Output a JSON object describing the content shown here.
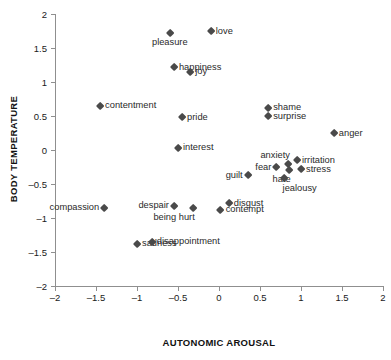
{
  "chart_data": {
    "type": "scatter",
    "title": "",
    "xlabel": "AUTONOMIC AROUSAL",
    "ylabel": "BODY TEMPERATURE",
    "xlim": [
      -2,
      2
    ],
    "ylim": [
      -2,
      2
    ],
    "xticks": [
      "–2",
      "–1.5",
      "–1",
      "–0.5",
      "0",
      "0.5",
      "1",
      "1.5",
      "2"
    ],
    "xtick_values": [
      -2,
      -1.5,
      -1,
      -0.5,
      0,
      0.5,
      1,
      1.5,
      2
    ],
    "yticks": [
      "2",
      "1.5",
      "1",
      "0.5",
      "0",
      "–0.5",
      "–1",
      "–1.5",
      "–2"
    ],
    "ytick_values": [
      2,
      1.5,
      1,
      0.5,
      0,
      -0.5,
      -1,
      -1.5,
      -2
    ],
    "grid": false,
    "legend": null,
    "marker": "diamond",
    "marker_color": "#4a4a4a",
    "points": [
      {
        "label": "love",
        "x": -0.1,
        "y": 1.75,
        "label_pos": "right"
      },
      {
        "label": "pleasure",
        "x": -0.6,
        "y": 1.72,
        "label_pos": "below"
      },
      {
        "label": "happiness",
        "x": -0.55,
        "y": 1.22,
        "label_pos": "right"
      },
      {
        "label": "joy",
        "x": -0.35,
        "y": 1.15,
        "label_pos": "right"
      },
      {
        "label": "contentment",
        "x": -1.45,
        "y": 0.65,
        "label_pos": "right"
      },
      {
        "label": "pride",
        "x": -0.45,
        "y": 0.48,
        "label_pos": "right"
      },
      {
        "label": "interest",
        "x": -0.5,
        "y": 0.03,
        "label_pos": "right"
      },
      {
        "label": "shame",
        "x": 0.6,
        "y": 0.62,
        "label_pos": "right"
      },
      {
        "label": "surprise",
        "x": 0.6,
        "y": 0.5,
        "label_pos": "right"
      },
      {
        "label": "anger",
        "x": 1.4,
        "y": 0.25,
        "label_pos": "right"
      },
      {
        "label": "anxiety",
        "x": 0.84,
        "y": -0.21,
        "label_pos": "aboveleft"
      },
      {
        "label": "irritation",
        "x": 0.95,
        "y": -0.15,
        "label_pos": "right"
      },
      {
        "label": "fear",
        "x": 0.7,
        "y": -0.25,
        "label_pos": "left"
      },
      {
        "label": "stress",
        "x": 1.0,
        "y": -0.28,
        "label_pos": "right"
      },
      {
        "label": "hate",
        "x": 0.85,
        "y": -0.3,
        "label_pos": "belowleft"
      },
      {
        "label": "jealousy",
        "x": 0.8,
        "y": -0.42,
        "label_pos": "belowright"
      },
      {
        "label": "guilt",
        "x": 0.35,
        "y": -0.37,
        "label_pos": "left"
      },
      {
        "label": "disgust",
        "x": 0.12,
        "y": -0.78,
        "label_pos": "right"
      },
      {
        "label": "contempt",
        "x": 0.02,
        "y": -0.88,
        "label_pos": "right"
      },
      {
        "label": "being hurt",
        "x": -0.32,
        "y": -0.85,
        "label_pos": "belowleft"
      },
      {
        "label": "despair",
        "x": -0.55,
        "y": -0.82,
        "label_pos": "left"
      },
      {
        "label": "compassion",
        "x": -1.4,
        "y": -0.85,
        "label_pos": "left"
      },
      {
        "label": "sadness",
        "x": -1.0,
        "y": -1.38,
        "label_pos": "right"
      },
      {
        "label": "disappointment",
        "x": -0.82,
        "y": -1.35,
        "label_pos": "right"
      }
    ]
  }
}
